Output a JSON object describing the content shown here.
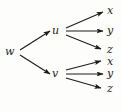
{
  "figure": {
    "kind": "directed-graph-diagram",
    "caption": "",
    "background_color": "#fdfdfc",
    "ink_color": "#1c1c1c",
    "width": 121,
    "height": 112
  },
  "nodes": [
    {
      "id": "w",
      "label": "w",
      "x": 9,
      "y": 52
    },
    {
      "id": "u",
      "label": "u",
      "x": 56,
      "y": 31
    },
    {
      "id": "v",
      "label": "v",
      "x": 56,
      "y": 74
    },
    {
      "id": "x1",
      "label": "x",
      "x": 110,
      "y": 11
    },
    {
      "id": "y1",
      "label": "y",
      "x": 110,
      "y": 31
    },
    {
      "id": "z1",
      "label": "z",
      "x": 110,
      "y": 50
    },
    {
      "id": "x2",
      "label": "x",
      "x": 110,
      "y": 62
    },
    {
      "id": "y2",
      "label": "y",
      "x": 110,
      "y": 74
    },
    {
      "id": "z2",
      "label": "z",
      "x": 110,
      "y": 89
    }
  ],
  "edges": [
    {
      "id": "w-u",
      "from": "w",
      "to": "u",
      "x1": 20,
      "y1": 50,
      "x2": 50,
      "y2": 31,
      "arrow": true
    },
    {
      "id": "w-v",
      "from": "w",
      "to": "v",
      "x1": 20,
      "y1": 55,
      "x2": 50,
      "y2": 74,
      "arrow": true
    },
    {
      "id": "u-x1",
      "from": "u",
      "to": "x1",
      "x1": 66,
      "y1": 28,
      "x2": 103,
      "y2": 12,
      "arrow": true
    },
    {
      "id": "u-y1",
      "from": "u",
      "to": "y1",
      "x1": 66,
      "y1": 31,
      "x2": 103,
      "y2": 31,
      "arrow": true
    },
    {
      "id": "u-z1",
      "from": "u",
      "to": "z1",
      "x1": 66,
      "y1": 35,
      "x2": 101,
      "y2": 49,
      "arrow": true
    },
    {
      "id": "v-x2",
      "from": "v",
      "to": "x2",
      "x1": 66,
      "y1": 70,
      "x2": 101,
      "y2": 61,
      "arrow": true
    },
    {
      "id": "v-y2",
      "from": "v",
      "to": "y2",
      "x1": 66,
      "y1": 74,
      "x2": 103,
      "y2": 74,
      "arrow": true
    },
    {
      "id": "v-z2",
      "from": "v",
      "to": "z2",
      "x1": 66,
      "y1": 78,
      "x2": 101,
      "y2": 88,
      "arrow": true
    }
  ]
}
